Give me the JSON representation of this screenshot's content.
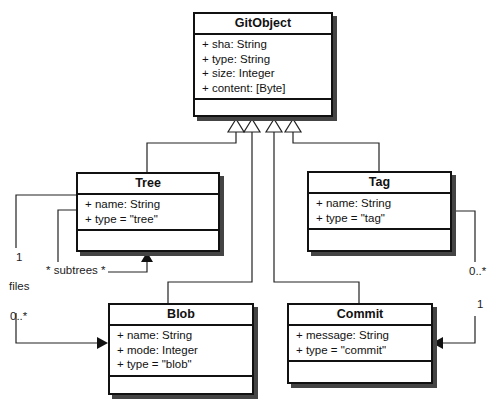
{
  "diagram": {
    "type": "UML class diagram",
    "classes": {
      "gitobject": {
        "name": "GitObject",
        "attributes": [
          "+ sha: String",
          "+ type: String",
          "+ size: Integer",
          "+ content: [Byte]"
        ]
      },
      "tree": {
        "name": "Tree",
        "attributes": [
          "+ name: String",
          "+ type = \"tree\""
        ]
      },
      "tag": {
        "name": "Tag",
        "attributes": [
          "+ name: String",
          "+ type = \"tag\""
        ]
      },
      "blob": {
        "name": "Blob",
        "attributes": [
          "+ name: String",
          "+ mode: Integer",
          "+ type = \"blob\""
        ]
      },
      "commit": {
        "name": "Commit",
        "attributes": [
          "+ message: String",
          "+ type = \"commit\""
        ]
      }
    },
    "generalizations": [
      {
        "child": "Tree",
        "parent": "GitObject"
      },
      {
        "child": "Blob",
        "parent": "GitObject"
      },
      {
        "child": "Commit",
        "parent": "GitObject"
      },
      {
        "child": "Tag",
        "parent": "GitObject"
      }
    ],
    "associations": [
      {
        "from": "Tree",
        "to": "Tree",
        "label": "* subtrees *"
      },
      {
        "from": "Tree",
        "to": "Blob",
        "label": "files",
        "source_multiplicity": "1",
        "target_multiplicity": "0..*"
      },
      {
        "from": "Tag",
        "to": "Commit",
        "source_multiplicity": "0..*",
        "target_multiplicity": "1"
      }
    ],
    "labels": {
      "subtrees": "* subtrees *",
      "files": "files",
      "tree_files_mult_source": "1",
      "tree_files_mult_target": "0..*",
      "tag_commit_mult_source": "0..*",
      "tag_commit_mult_target": "1"
    }
  }
}
